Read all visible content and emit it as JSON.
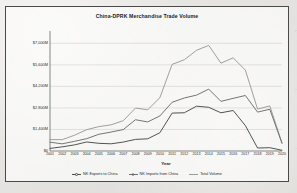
{
  "chart_data": {
    "type": "line",
    "title": "China-DPRK Merchandise Trade Volume",
    "xlabel": "Year",
    "ylabel": "",
    "grid": true,
    "legend_position": "bottom",
    "categories": [
      "2001",
      "2002",
      "2003",
      "2004",
      "2005",
      "2006",
      "2007",
      "2008",
      "2009",
      "2010",
      "2011",
      "2012",
      "2013",
      "2014",
      "2015",
      "2016",
      "2017",
      "2018",
      "2019",
      "2020"
    ],
    "ylim": [
      0,
      7800
    ],
    "yticks": [
      0,
      1400,
      2800,
      4200,
      5600,
      7000
    ],
    "ytick_labels": [
      "$0",
      "$1,400M",
      "$2,800M",
      "$4,200M",
      "$5,600M",
      "$7,000M"
    ],
    "series": [
      {
        "name": "NK Exports to China",
        "color": "#4a4a4a",
        "values": [
          167,
          271,
          395,
          586,
          499,
          468,
          582,
          754,
          793,
          1188,
          2464,
          2485,
          2912,
          2841,
          2483,
          2634,
          1651,
          195,
          215,
          48
        ]
      },
      {
        "name": "NK Imports from China",
        "color": "#6e6e6e",
        "values": [
          573,
          467,
          628,
          800,
          1085,
          1232,
          1392,
          2033,
          1888,
          2278,
          3165,
          3446,
          3633,
          4023,
          3226,
          3422,
          3608,
          2528,
          2716,
          491
        ]
      },
      {
        "name": "Total Volume",
        "color": "#9a9a9a",
        "values": [
          740,
          738,
          1023,
          1386,
          1584,
          1700,
          1974,
          2787,
          2681,
          3466,
          5629,
          5931,
          6545,
          6864,
          5709,
          6056,
          5259,
          2723,
          2931,
          539
        ]
      }
    ]
  },
  "legend": {
    "items": [
      {
        "label": "NK Exports to China",
        "marker": "diamond-marker"
      },
      {
        "label": "NK Imports from China",
        "marker": "circle-marker"
      },
      {
        "label": "Total Volume",
        "marker": "line-marker"
      }
    ]
  }
}
